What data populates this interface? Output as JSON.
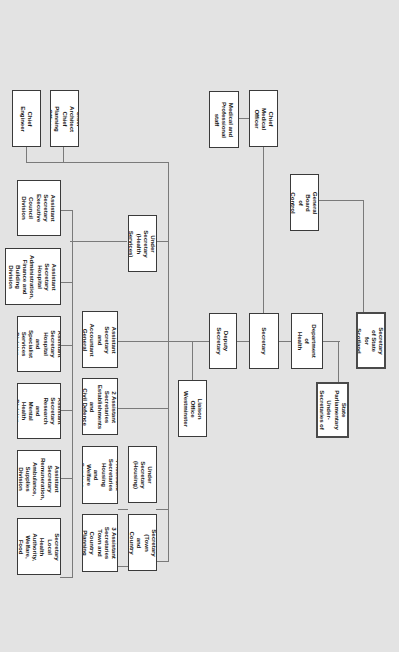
{
  "orientation": "rotated 90° clockwise",
  "colors": {
    "background": "#e3e3e3",
    "box_fill": "#ffffff",
    "box_border": "#3a3a3a",
    "connector": "#7a7a7a"
  },
  "nodes": {
    "secretary_of_state": "Secretary of State\nfor Scotland",
    "minister_of_state": "Minister of State\nParliamentary\nUnder-Secretaries of\nState (3)",
    "general_board": "General Board\nof Control",
    "department_of_health": "Department of\nHealth",
    "secretary": "Secretary",
    "deputy_secretary": "Deputy Secretary",
    "liaison_office": "Liaison Office\nWestminster",
    "chief_medical_officer": "Chief\nMedical Officer",
    "medical_staff": "Medical and\nProfessional staff",
    "chief_engineer": "Chief\nEngineer",
    "chief_architect": "Chief Architect\nChief Planning Officer",
    "under_sec_health": "Under Secretary\n(Health Services)",
    "under_sec_housing": "Under Secretary\n(Housing)",
    "under_sec_town": "Under Secretary\n(Town and Country\nPlanning)",
    "as_accountant": "Assistant Secretary\nand\nAccountant General",
    "as_establishments": "2 Assistant Secretaries\nEstablishments and\nCivil Defence",
    "as_housing": "4 Assistant Secretaries\nHousing and Welfare\nServices",
    "as_town": "3 Assistant Secretaries\nTown and Country\nPlanning",
    "as_executive": "Assistant Secretary\nExecutive Council\nDivision",
    "as_hospital_admin": "Assistant Secretary\nHospital\nAdministration,\nFinance and Building\nDivision",
    "as_hospital_specialist": "Assistant Secretary\nHospital and Specialist\nServices Division",
    "as_research": "Assistant Secretary\nResearch and Mental\nHealth Division",
    "as_remuneration": "Assistant Secretary\nRemuneration,\nAmbulance, Supplies\nDivision",
    "as_local_health": "Assistant Secretary\nLocal Health Authority,\nWelfare, Food Division"
  }
}
